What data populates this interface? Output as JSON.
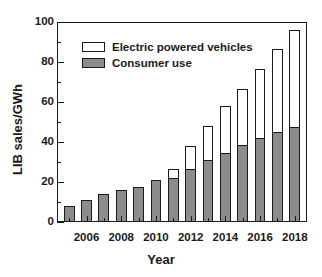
{
  "chart_data": {
    "type": "bar",
    "title": "",
    "subtitle": "",
    "xlabel": "Year",
    "ylabel": "LIB sales/GWh",
    "stacked": true,
    "grid": false,
    "legend_position": "upper-left-inside",
    "xlim": [
      2004.3,
      2018.7
    ],
    "ylim": [
      0,
      100
    ],
    "yticks": [
      0,
      20,
      40,
      60,
      80,
      100
    ],
    "ytick_labels": [
      "0",
      "20",
      "40",
      "60",
      "80",
      "100"
    ],
    "yminor_ticks": [
      10,
      30,
      50,
      70,
      90
    ],
    "xticks_major": [
      2006,
      2008,
      2010,
      2012,
      2014,
      2016,
      2018
    ],
    "xtick_labels": [
      "2006",
      "2008",
      "2010",
      "2012",
      "2014",
      "2016",
      "2018"
    ],
    "xminor_ticks": [
      2005,
      2007,
      2009,
      2011,
      2013,
      2015,
      2017
    ],
    "categories": [
      2005,
      2006,
      2007,
      2008,
      2009,
      2010,
      2011,
      2012,
      2013,
      2014,
      2015,
      2016,
      2017,
      2018
    ],
    "series": [
      {
        "name": "Consumer use",
        "color": "#8c8c8c",
        "values": [
          8,
          11,
          14,
          16,
          17.5,
          21,
          22,
          26.5,
          31,
          34.5,
          38.5,
          42,
          45,
          47.5
        ]
      },
      {
        "name": "Electric powered vehicles",
        "color": "#ffffff",
        "values": [
          0,
          0,
          0,
          0,
          0,
          0,
          4.5,
          11.5,
          17,
          23.5,
          28,
          34.5,
          41.5,
          48.5
        ]
      }
    ],
    "totals": [
      8,
      11,
      14,
      16,
      17.5,
      21,
      26.5,
      38,
      48,
      58,
      66.5,
      76.5,
      86.5,
      96
    ],
    "colors": {
      "axis": "#1a1a1a",
      "bar_fill": "#8c8c8c",
      "bar_edge": "#1a1a1a",
      "background": "#ffffff"
    }
  },
  "legend": {
    "items": [
      {
        "label": "Electric powered vehicles",
        "style": "hollow"
      },
      {
        "label": "Consumer use",
        "style": "filled"
      }
    ]
  }
}
